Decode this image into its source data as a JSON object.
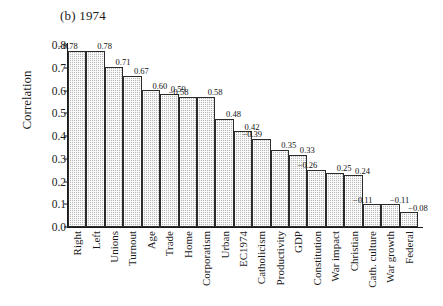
{
  "chart_data": {
    "type": "bar",
    "title": "(b) 1974",
    "xlabel": "",
    "ylabel": "Correlation",
    "ylim": [
      0.0,
      0.8
    ],
    "yticks": [
      "0.0",
      "0.1",
      "0.2",
      "0.3",
      "0.4",
      "0.5",
      "0.6",
      "0.7",
      "0.8"
    ],
    "grid": false,
    "legend": null,
    "categories": [
      "Right",
      "Left",
      "Unions",
      "Turnout",
      "Age",
      "Trade",
      "Home",
      "Corporatism",
      "Urban",
      "EC1974",
      "Catholicism",
      "Productivity",
      "GDP",
      "Constitution",
      "War impact",
      "Christian",
      "Cath. culture",
      "War growth",
      "Federal"
    ],
    "values": [
      0.775,
      0.775,
      0.705,
      0.665,
      0.602,
      0.586,
      0.572,
      0.572,
      0.476,
      0.421,
      0.389,
      0.34,
      0.318,
      0.251,
      0.239,
      0.227,
      0.1,
      0.1,
      0.065
    ],
    "data_labels": [
      "−0.78",
      "0.78",
      "0.71",
      "0.67",
      "0.60",
      "0.59",
      "−0.58",
      "0.58",
      "0.48",
      "0.42",
      "−0.39",
      "0.35",
      "0.33",
      "−0.26",
      "0.25",
      "0.24",
      "−0.11",
      "−0.11",
      "−0.08"
    ],
    "label_offsets": [
      "shift-left",
      "shift-right",
      "shift-right",
      "shift-right",
      "shift-right",
      "shift-right",
      "shift-left",
      "shift-right",
      "shift-right",
      "shift-right",
      "shift-left",
      "shift-right",
      "shift-right",
      "shift-left",
      "shift-right",
      "shift-right",
      "shift-left",
      "shift-right",
      "shift-right"
    ],
    "colors": {
      "bar_fill": "#b9b9b9",
      "bar_edge": "#2b2b2b",
      "axis": "#1a1a1a",
      "text": "#1a1a1a",
      "background": "#ffffff"
    }
  }
}
